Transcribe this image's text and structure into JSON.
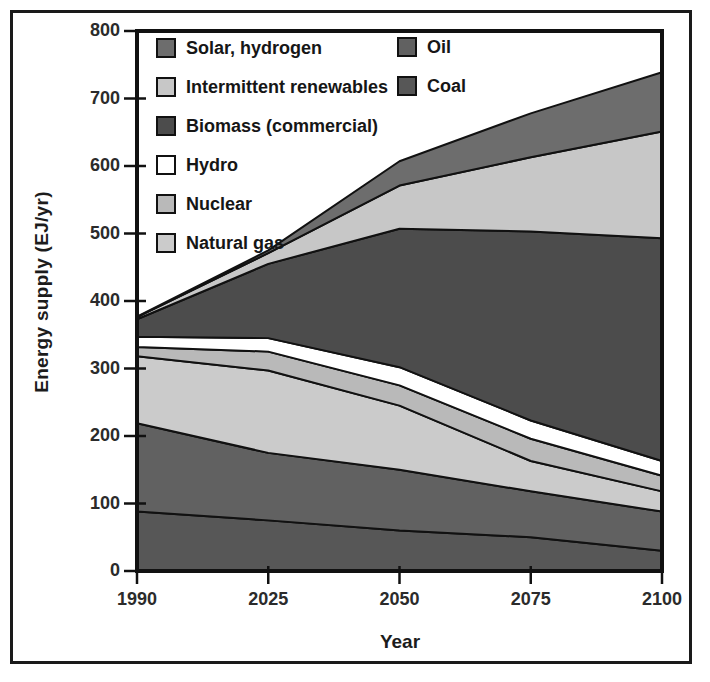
{
  "figure": {
    "background": "#ffffff",
    "frame_color": "#1a1a1a"
  },
  "chart_data": {
    "type": "area",
    "stacked": true,
    "title": "",
    "xlabel": "Year",
    "ylabel": "Energy supply (EJ/yr)",
    "categories": [
      "1990",
      "2025",
      "2050",
      "2075",
      "2100"
    ],
    "ylim": [
      0,
      800
    ],
    "ytick_interval": 100,
    "grid": false,
    "legend_position": "top-left-inside",
    "axis_color": "#111111",
    "band_outline_color": "#111111",
    "series_bottom_to_top": [
      {
        "name": "Coal",
        "color": "#575757",
        "values": [
          88,
          75,
          60,
          50,
          30
        ]
      },
      {
        "name": "Oil",
        "color": "#616161",
        "values": [
          131,
          100,
          90,
          68,
          58
        ]
      },
      {
        "name": "Natural gas",
        "color": "#cbcbcb",
        "values": [
          99,
          122,
          95,
          45,
          30
        ]
      },
      {
        "name": "Nuclear",
        "color": "#b9b9b9",
        "values": [
          14,
          28,
          30,
          33,
          23
        ]
      },
      {
        "name": "Hydro",
        "color": "#ffffff",
        "values": [
          15,
          20,
          27,
          27,
          22
        ]
      },
      {
        "name": "Biomass (commercial)",
        "color": "#4c4c4c",
        "values": [
          26,
          110,
          205,
          280,
          330
        ]
      },
      {
        "name": "Intermittent renewables",
        "color": "#c7c7c7",
        "values": [
          3,
          16,
          64,
          110,
          158
        ]
      },
      {
        "name": "Solar, hydrogen",
        "color": "#6d6d6d",
        "values": [
          1,
          4,
          36,
          65,
          88
        ]
      }
    ],
    "stack_totals": [
      377,
      475,
      607,
      678,
      739
    ]
  },
  "legend": {
    "column1": [
      "Solar, hydrogen",
      "Intermittent renewables",
      "Biomass (commercial)",
      "Hydro",
      "Nuclear",
      "Natural gas"
    ],
    "column2": [
      "Oil",
      "Coal"
    ]
  }
}
